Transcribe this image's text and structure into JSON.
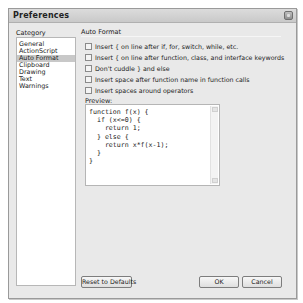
{
  "window": {
    "title": "Preferences"
  },
  "sidebar": {
    "header": "Category",
    "items": [
      {
        "label": "General",
        "selected": false
      },
      {
        "label": "ActionScript",
        "selected": false
      },
      {
        "label": "Auto Format",
        "selected": true
      },
      {
        "label": "Clipboard",
        "selected": false
      },
      {
        "label": "Drawing",
        "selected": false
      },
      {
        "label": "Text",
        "selected": false
      },
      {
        "label": "Warnings",
        "selected": false
      }
    ]
  },
  "main": {
    "section_title": "Auto Format",
    "options": [
      {
        "label": "Insert { on line after if, for, switch, while, etc.",
        "checked": false
      },
      {
        "label": "Insert { on line after function, class, and interface keywords",
        "checked": false
      },
      {
        "label": "Don't cuddle } and else",
        "checked": false
      },
      {
        "label": "Insert space after function name in function calls",
        "checked": false
      },
      {
        "label": "Insert spaces around operators",
        "checked": false
      }
    ],
    "preview_label": "Preview:",
    "preview_code": "function f(x) {\n  if (x<=0) {\n    return 1;\n  } else {\n    return x*f(x-1);\n  }\n}"
  },
  "buttons": {
    "reset": "Reset to Defaults",
    "ok": "OK",
    "cancel": "Cancel"
  }
}
